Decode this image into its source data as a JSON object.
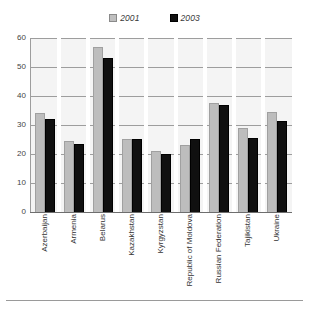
{
  "chart_data": {
    "type": "bar",
    "title": "",
    "xlabel": "",
    "ylabel": "",
    "ylim": [
      0,
      60
    ],
    "yticks": [
      0,
      10,
      20,
      30,
      40,
      50,
      60
    ],
    "grid": true,
    "legend_position": "top-center",
    "categories": [
      "Azerbaijan",
      "Armenia",
      "Belarus",
      "Kazakhstan",
      "Kyrgyzstan",
      "Republic of Moldova",
      "Russian Federation",
      "Tajikistan",
      "Ukraine"
    ],
    "series": [
      {
        "name": "2001",
        "color": "#bdbdbd",
        "values": [
          34,
          24.5,
          57,
          25,
          21,
          23,
          37.5,
          29,
          34.5
        ]
      },
      {
        "name": "2003",
        "color": "#101010",
        "values": [
          32,
          23.5,
          53,
          25,
          20,
          25,
          37,
          25.5,
          31.5
        ]
      }
    ]
  },
  "legend": {
    "entries": [
      {
        "label": "2001",
        "swatch": "light-gray-pattern-swatch"
      },
      {
        "label": "2003",
        "swatch": "black-swatch"
      }
    ]
  },
  "axis": {
    "y_tick_labels": [
      "60",
      "50",
      "40",
      "30",
      "20",
      "10",
      "0"
    ]
  },
  "colors": {
    "series_2001": "#bdbdbd",
    "series_2003": "#101010",
    "plot_background": "#f4f4f4",
    "gridline": "#9d9d9d",
    "text": "#333333"
  }
}
